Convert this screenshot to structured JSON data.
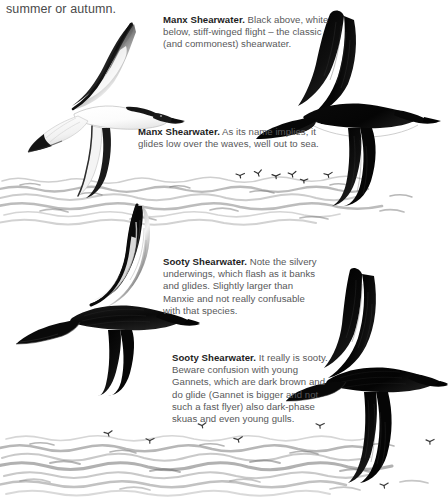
{
  "page": {
    "running_text": "summer or autumn.",
    "background_color": "#ffffff",
    "text_color": "#58585a",
    "heading_color": "#1d1d1d"
  },
  "captions": [
    {
      "id": "manx-underside",
      "species": "Manx Shearwater.",
      "body": " Black above, white below, stiff-winged flight – the classic (and commonest) shearwater."
    },
    {
      "id": "manx-glide",
      "species": "Manx Shearwater.",
      "body": " As its name implies, it glides low over the waves, well out to sea."
    },
    {
      "id": "sooty-underwing",
      "species": "Sooty Shearwater.",
      "body": " Note the silvery underwings, which flash as it banks and glides. Slightly larger than Manxie and not really confusable with that species."
    },
    {
      "id": "sooty-upperside",
      "species": "Sooty Shearwater.",
      "body": " It really is sooty. Beware confusion with young Gannets, which are dark brown and do glide (Gannet is bigger and not such a fast flyer) also dark-phase skuas and even young gulls."
    }
  ],
  "figures": [
    {
      "id": "manx-shearwater-underside",
      "label": "Manx Shearwater banking, underside view",
      "plumage": "white below, black above",
      "position": "upper-left"
    },
    {
      "id": "manx-shearwater-upperside",
      "label": "Manx Shearwater gliding, upperside view",
      "plumage": "black above",
      "position": "upper-right"
    },
    {
      "id": "sooty-shearwater-underside",
      "label": "Sooty Shearwater banking, silvery underwing flash",
      "plumage": "dark sooty with silvery underwings",
      "position": "mid-left"
    },
    {
      "id": "sooty-shearwater-upperside",
      "label": "Sooty Shearwater gliding, upperside view",
      "plumage": "all dark sooty brown",
      "position": "lower-right"
    }
  ],
  "scenery": {
    "sea_bands": [
      {
        "id": "sea-band-upper",
        "label": "open sea with waves"
      },
      {
        "id": "sea-band-lower",
        "label": "open sea with waves"
      }
    ],
    "distant_flocks": [
      {
        "id": "distant-flock-upper",
        "label": "distant shearwaters over the sea",
        "count": 6
      },
      {
        "id": "distant-flock-lower-left",
        "label": "distant shearwaters over the sea",
        "count": 3
      },
      {
        "id": "distant-flock-lower-right",
        "label": "distant shearwaters over the sea",
        "count": 3
      }
    ]
  }
}
